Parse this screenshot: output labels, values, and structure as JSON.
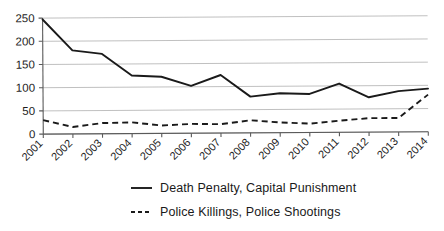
{
  "chart_data": {
    "type": "line",
    "title": "",
    "subtitle": "",
    "xlabel": "",
    "ylabel": "",
    "categories": [
      "2001",
      "2002",
      "2003",
      "2004",
      "2005",
      "2006",
      "2007",
      "2008",
      "2009",
      "2010",
      "2011",
      "2012",
      "2013",
      "2014"
    ],
    "x": [
      2001,
      2002,
      2003,
      2004,
      2005,
      2006,
      2007,
      2008,
      2009,
      2010,
      2011,
      2012,
      2013,
      2014
    ],
    "ylim": [
      0,
      250
    ],
    "yticks": [
      0,
      50,
      100,
      150,
      200,
      250
    ],
    "ytick_labels": [
      "0",
      "50",
      "100",
      "150",
      "200",
      "250"
    ],
    "xtick_labels": [
      "2001",
      "2002",
      "2003",
      "2004",
      "2005",
      "2006",
      "2007",
      "2008",
      "2009",
      "2010",
      "2011",
      "2012",
      "2013",
      "2014"
    ],
    "xtick_rotation_deg": 45,
    "grid": true,
    "grid_axis": "y",
    "legend_position": "bottom",
    "series": [
      {
        "name": "Death Penalty, Capital Punishment",
        "style": "solid",
        "color": "#1a1a1a",
        "values": [
          247,
          180,
          172,
          125,
          122,
          102,
          125,
          78,
          85,
          83,
          105,
          75,
          88,
          93
        ]
      },
      {
        "name": "Police Killings, Police Shootings",
        "style": "dashed",
        "color": "#1a1a1a",
        "values": [
          30,
          15,
          23,
          24,
          17,
          20,
          19,
          27,
          22,
          19,
          25,
          30,
          30,
          80
        ]
      }
    ]
  },
  "legend": {
    "items": [
      {
        "label": "Death Penalty, Capital Punishment",
        "style": "solid"
      },
      {
        "label": "Police Killings, Police Shootings",
        "style": "dashed"
      }
    ]
  },
  "colors": {
    "line": "#1a1a1a",
    "grid": "#b9b9b9",
    "axis": "#5a5a5a",
    "background": "#ffffff"
  }
}
